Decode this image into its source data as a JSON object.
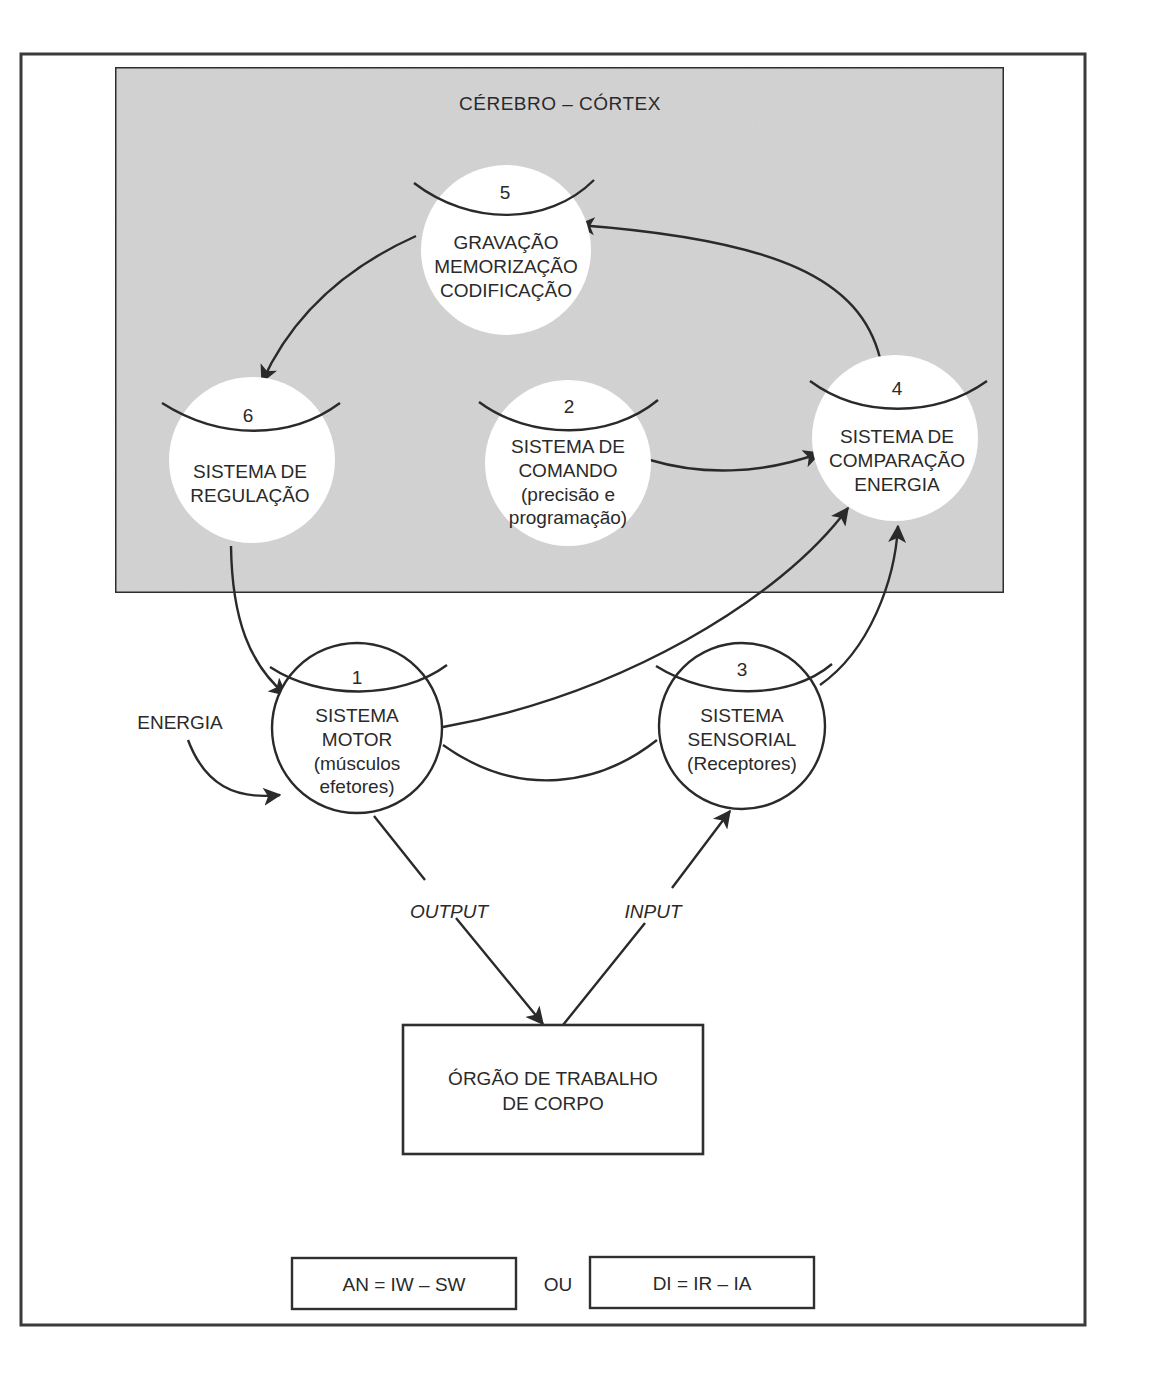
{
  "diagram": {
    "region_title": "CÉREBRO – CÓRTEX",
    "colors": {
      "region_fill": "#d4d4d4",
      "stroke": "#2a2a2a",
      "node_fill": "#ffffff",
      "background": "#ffffff"
    },
    "nodes": [
      {
        "id": "5",
        "number": "5",
        "lines": [
          "GRAVAÇÃO",
          "MEMORIZAÇÃO",
          "CODIFICAÇÃO"
        ],
        "in_region": true
      },
      {
        "id": "6",
        "number": "6",
        "lines": [
          "SISTEMA DE",
          "REGULAÇÃO"
        ],
        "in_region": true
      },
      {
        "id": "2",
        "number": "2",
        "lines": [
          "SISTEMA DE",
          "COMANDO",
          "(precisão e",
          "programação)"
        ],
        "in_region": true
      },
      {
        "id": "4",
        "number": "4",
        "lines": [
          "SISTEMA DE",
          "COMPARAÇÃO",
          "ENERGIA"
        ],
        "in_region": true
      },
      {
        "id": "1",
        "number": "1",
        "lines": [
          "SISTEMA",
          "MOTOR",
          "(músculos",
          "efetores)"
        ],
        "in_region": false
      },
      {
        "id": "3",
        "number": "3",
        "lines": [
          "SISTEMA",
          "SENSORIAL",
          "(Receptores)"
        ],
        "in_region": false
      }
    ],
    "external_input": {
      "label": "ENERGIA",
      "target": "1"
    },
    "body_organ": {
      "lines": [
        "ÓRGÃO DE TRABALHO",
        "DE CORPO"
      ]
    },
    "edges": [
      {
        "from": "4",
        "to": "5"
      },
      {
        "from": "5",
        "to": "6"
      },
      {
        "from": "2",
        "to": "4"
      },
      {
        "from": "6",
        "to": "1"
      },
      {
        "from": "1",
        "to": "4"
      },
      {
        "from": "3",
        "to": "4"
      },
      {
        "from": "1",
        "to": "3"
      },
      {
        "from": "ENERGIA",
        "to": "1"
      },
      {
        "from": "1",
        "to": "organ",
        "label": "OUTPUT"
      },
      {
        "from": "organ",
        "to": "3",
        "label": "INPUT"
      }
    ],
    "edge_labels": {
      "output": "OUTPUT",
      "input": "INPUT"
    },
    "formulas": {
      "left": "AN = IW – SW",
      "connector": "OU",
      "right": "DI = IR – IA"
    }
  }
}
